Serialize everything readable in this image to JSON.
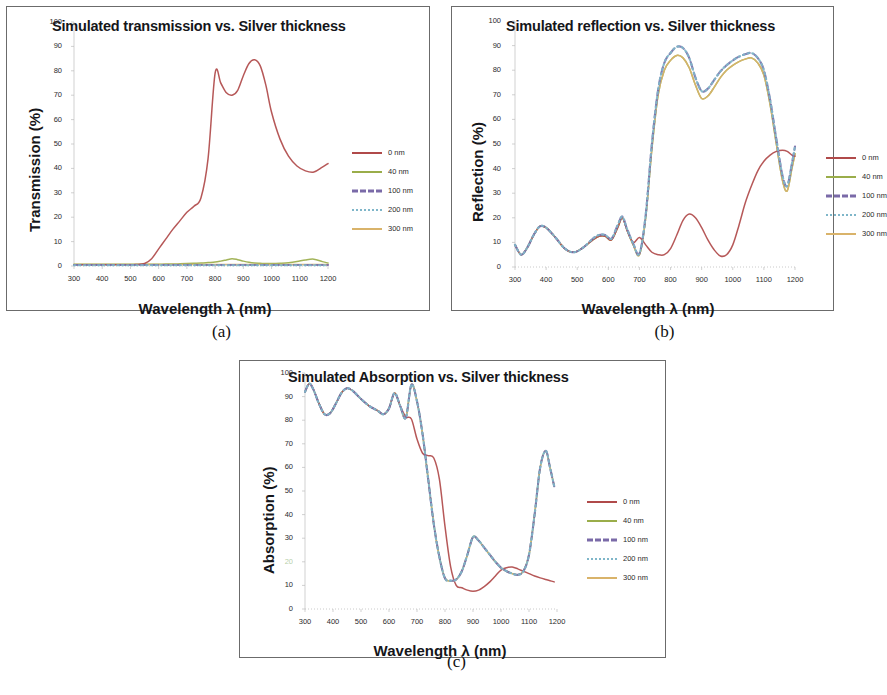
{
  "figure": {
    "panels": [
      {
        "caption": "(a)",
        "title": "Simulated transmission vs. Silver thickness",
        "ylabel": "Transmission (%)",
        "xlabel": "Wavelength λ (nm)"
      },
      {
        "caption": "(b)",
        "title": "Simulated reflection vs. Silver thickness",
        "ylabel": "Reflection (%)",
        "xlabel": "Wavelength λ (nm)"
      },
      {
        "caption": "(c)",
        "title": "Simulated Absorption vs. Silver thickness",
        "ylabel": "Absorption (%)",
        "xlabel": "Wavelength λ (nm)"
      }
    ]
  },
  "colors": {
    "series_0nm": "#b04a4a",
    "series_40nm": "#9aad4a",
    "series_100nm": "#7a6aa8",
    "series_200nm": "#7fb6c9",
    "series_300nm": "#d9b36a",
    "axis": "#bdbdbd",
    "border": "#6b6b6b",
    "text": "#15161a"
  },
  "chart_data": [
    {
      "type": "line",
      "title": "Simulated transmission vs. Silver thickness",
      "xlabel": "Wavelength λ (nm)",
      "ylabel": "Transmission (%)",
      "xlim": [
        300,
        1200
      ],
      "ylim": [
        0,
        100
      ],
      "xticks": [
        300,
        400,
        500,
        600,
        700,
        800,
        900,
        1000,
        1100,
        1200
      ],
      "yticks": [
        0,
        10,
        20,
        30,
        40,
        50,
        60,
        70,
        80,
        90,
        100
      ],
      "grid": false,
      "legend_position": "right",
      "x": [
        300,
        350,
        400,
        450,
        500,
        520,
        550,
        575,
        600,
        625,
        650,
        675,
        700,
        725,
        750,
        775,
        800,
        820,
        840,
        860,
        880,
        900,
        920,
        940,
        960,
        980,
        1000,
        1030,
        1060,
        1090,
        1120,
        1150,
        1180,
        1200
      ],
      "series": [
        {
          "name": "0 nm",
          "color": "#b04a4a",
          "style": "solid",
          "values": [
            0.5,
            0.5,
            0.5,
            0.5,
            0.5,
            0.6,
            1.0,
            3.0,
            7.0,
            11.0,
            15.0,
            18.5,
            22.0,
            24.5,
            28.0,
            44.0,
            79.0,
            75.0,
            71.0,
            70.0,
            72.0,
            78.0,
            83.0,
            84.5,
            82.0,
            74.0,
            63.0,
            52.0,
            45.0,
            41.0,
            39.0,
            38.5,
            40.5,
            42.0
          ]
        },
        {
          "name": "40 nm",
          "color": "#9aad4a",
          "style": "solid",
          "values": [
            0.7,
            0.7,
            0.7,
            0.7,
            0.7,
            0.7,
            0.7,
            0.7,
            0.7,
            0.8,
            0.8,
            0.9,
            1.0,
            1.1,
            1.2,
            1.4,
            1.6,
            2.0,
            2.5,
            3.0,
            2.6,
            2.0,
            1.5,
            1.2,
            1.1,
            1.0,
            1.0,
            1.1,
            1.3,
            1.8,
            2.5,
            2.8,
            1.8,
            1.2
          ]
        },
        {
          "name": "100 nm",
          "color": "#7a6aa8",
          "style": "dashed",
          "values": [
            0.4,
            0.4,
            0.4,
            0.4,
            0.4,
            0.4,
            0.4,
            0.4,
            0.4,
            0.4,
            0.4,
            0.4,
            0.4,
            0.4,
            0.4,
            0.4,
            0.4,
            0.4,
            0.4,
            0.4,
            0.4,
            0.4,
            0.4,
            0.4,
            0.4,
            0.4,
            0.4,
            0.4,
            0.4,
            0.4,
            0.4,
            0.4,
            0.4,
            0.4
          ]
        },
        {
          "name": "200 nm",
          "color": "#7fb6c9",
          "style": "dotted",
          "values": [
            0.3,
            0.3,
            0.3,
            0.3,
            0.3,
            0.3,
            0.3,
            0.3,
            0.3,
            0.3,
            0.3,
            0.3,
            0.3,
            0.3,
            0.3,
            0.3,
            0.3,
            0.3,
            0.3,
            0.3,
            0.3,
            0.3,
            0.3,
            0.3,
            0.3,
            0.3,
            0.3,
            0.3,
            0.3,
            0.3,
            0.3,
            0.3,
            0.3,
            0.3
          ]
        },
        {
          "name": "300 nm",
          "color": "#d9b36a",
          "style": "solid",
          "values": [
            0.6,
            0.6,
            0.6,
            0.6,
            0.6,
            0.6,
            0.6,
            0.6,
            0.6,
            0.6,
            0.6,
            0.6,
            0.6,
            0.6,
            0.6,
            0.6,
            0.6,
            0.6,
            0.6,
            0.6,
            0.6,
            0.6,
            0.6,
            0.6,
            0.6,
            0.6,
            0.6,
            0.6,
            0.6,
            0.6,
            0.6,
            0.6,
            0.6,
            0.6
          ]
        }
      ]
    },
    {
      "type": "line",
      "title": "Simulated reflection vs. Silver thickness",
      "xlabel": "Wavelength λ (nm)",
      "ylabel": "Reflection (%)",
      "xlim": [
        300,
        1200
      ],
      "ylim": [
        0,
        100
      ],
      "xticks": [
        300,
        400,
        500,
        600,
        700,
        800,
        900,
        1000,
        1100,
        1200
      ],
      "yticks": [
        0,
        10,
        20,
        30,
        40,
        50,
        60,
        70,
        80,
        90,
        100
      ],
      "grid": false,
      "legend_position": "right",
      "x": [
        300,
        320,
        340,
        360,
        380,
        400,
        430,
        460,
        490,
        520,
        550,
        570,
        590,
        610,
        630,
        645,
        660,
        680,
        700,
        720,
        740,
        760,
        780,
        800,
        820,
        840,
        860,
        880,
        900,
        920,
        940,
        960,
        980,
        1000,
        1020,
        1040,
        1060,
        1080,
        1100,
        1120,
        1140,
        1160,
        1175,
        1190,
        1200
      ],
      "series": [
        {
          "name": "0 nm",
          "color": "#b04a4a",
          "style": "solid",
          "values": [
            9.0,
            5.0,
            8.0,
            13.0,
            16.5,
            16.0,
            12.0,
            7.5,
            6.0,
            8.0,
            11.0,
            12.5,
            12.5,
            11.0,
            16.0,
            20.0,
            15.0,
            10.0,
            12.0,
            9.0,
            6.0,
            5.0,
            5.0,
            7.5,
            13.0,
            19.0,
            21.5,
            20.0,
            16.0,
            11.0,
            7.0,
            4.5,
            5.0,
            9.0,
            17.0,
            26.0,
            33.0,
            39.0,
            43.0,
            45.5,
            47.0,
            47.5,
            47.0,
            45.5,
            45.0
          ]
        },
        {
          "name": "40 nm",
          "color": "#9aad4a",
          "style": "solid",
          "values": [
            9.0,
            5.0,
            8.0,
            13.0,
            16.5,
            16.0,
            12.0,
            7.5,
            6.0,
            8.0,
            11.0,
            12.5,
            12.5,
            11.0,
            16.0,
            20.0,
            15.0,
            9.0,
            5.0,
            20.0,
            48.0,
            70.0,
            80.0,
            84.0,
            86.0,
            85.0,
            81.0,
            74.0,
            68.5,
            69.5,
            73.0,
            77.0,
            80.0,
            82.0,
            83.5,
            84.5,
            85.0,
            83.0,
            78.0,
            66.0,
            50.0,
            35.0,
            31.0,
            40.0,
            46.0
          ]
        },
        {
          "name": "100 nm",
          "color": "#7a6aa8",
          "style": "dashed",
          "values": [
            9.0,
            5.0,
            8.0,
            13.0,
            16.5,
            16.0,
            12.0,
            7.5,
            6.0,
            8.0,
            11.5,
            13.0,
            13.0,
            11.5,
            17.0,
            20.5,
            15.5,
            9.5,
            5.5,
            21.0,
            50.0,
            72.0,
            83.0,
            87.0,
            89.5,
            89.0,
            85.0,
            77.0,
            71.5,
            72.5,
            76.0,
            79.5,
            82.0,
            84.0,
            85.5,
            86.5,
            87.0,
            85.0,
            80.0,
            68.0,
            52.0,
            37.0,
            33.0,
            42.0,
            49.0
          ]
        },
        {
          "name": "200 nm",
          "color": "#7fb6c9",
          "style": "dotted",
          "values": [
            9.0,
            5.0,
            8.0,
            13.0,
            16.5,
            16.0,
            12.0,
            7.5,
            6.0,
            8.0,
            11.5,
            13.0,
            13.0,
            11.5,
            17.0,
            20.5,
            15.5,
            9.5,
            5.5,
            21.0,
            50.0,
            72.0,
            83.0,
            87.0,
            89.5,
            89.0,
            85.0,
            77.0,
            71.5,
            72.5,
            76.0,
            79.5,
            82.0,
            84.0,
            85.5,
            86.5,
            87.0,
            85.0,
            80.0,
            68.0,
            52.0,
            37.0,
            33.0,
            42.0,
            49.0
          ]
        },
        {
          "name": "300 nm",
          "color": "#d9b36a",
          "style": "solid",
          "values": [
            9.0,
            5.0,
            8.0,
            13.0,
            16.5,
            16.0,
            12.0,
            7.5,
            6.0,
            8.0,
            11.0,
            12.5,
            12.5,
            11.0,
            16.0,
            20.0,
            15.0,
            9.0,
            5.0,
            20.0,
            48.0,
            70.0,
            80.0,
            84.0,
            86.0,
            85.0,
            81.0,
            74.0,
            68.5,
            69.5,
            73.0,
            77.0,
            80.0,
            82.0,
            83.5,
            84.5,
            85.0,
            83.0,
            78.0,
            66.0,
            50.0,
            35.0,
            31.0,
            40.0,
            46.0
          ]
        }
      ]
    },
    {
      "type": "line",
      "title": "Simulated Absorption vs. Silver thickness",
      "xlabel": "Wavelength λ (nm)",
      "ylabel": "Absorption (%)",
      "xlim": [
        300,
        1200
      ],
      "ylim": [
        0,
        100
      ],
      "xticks": [
        300,
        400,
        500,
        600,
        700,
        800,
        900,
        1000,
        1100,
        1200
      ],
      "yticks": [
        0,
        10,
        20,
        30,
        40,
        50,
        60,
        70,
        80,
        90,
        100
      ],
      "grid": false,
      "legend_position": "right",
      "x": [
        300,
        315,
        330,
        350,
        370,
        390,
        410,
        430,
        450,
        470,
        500,
        530,
        560,
        580,
        600,
        620,
        640,
        660,
        680,
        700,
        720,
        740,
        760,
        780,
        800,
        820,
        840,
        860,
        880,
        900,
        920,
        940,
        960,
        980,
        1000,
        1020,
        1040,
        1060,
        1080,
        1100,
        1120,
        1140,
        1160,
        1175,
        1190
      ],
      "series": [
        {
          "name": "0 nm",
          "color": "#b04a4a",
          "style": "solid",
          "values": [
            92.0,
            95.5,
            93.0,
            87.0,
            82.5,
            83.0,
            87.0,
            91.5,
            93.5,
            92.5,
            89.0,
            86.0,
            84.0,
            82.5,
            85.0,
            91.5,
            86.0,
            81.5,
            80.5,
            72.0,
            66.0,
            65.0,
            64.0,
            55.0,
            35.0,
            18.0,
            10.0,
            9.0,
            8.0,
            7.5,
            8.0,
            9.5,
            11.5,
            14.0,
            16.5,
            17.5,
            17.8,
            17.0,
            16.0,
            15.0,
            14.0,
            13.2,
            12.5,
            12.0,
            11.5
          ]
        },
        {
          "name": "40 nm",
          "color": "#9aad4a",
          "style": "solid",
          "values": [
            92.0,
            95.5,
            93.0,
            87.0,
            82.5,
            83.0,
            87.0,
            91.5,
            93.5,
            92.5,
            89.0,
            86.0,
            84.0,
            82.5,
            85.0,
            91.5,
            86.0,
            81.0,
            95.0,
            88.0,
            74.0,
            55.0,
            36.0,
            22.0,
            13.0,
            12.0,
            12.5,
            16.0,
            23.0,
            30.5,
            29.0,
            26.0,
            23.0,
            20.0,
            17.5,
            16.0,
            15.0,
            14.5,
            16.0,
            23.0,
            40.0,
            60.0,
            67.0,
            60.0,
            52.0
          ]
        },
        {
          "name": "100 nm",
          "color": "#7a6aa8",
          "style": "dashed",
          "values": [
            92.0,
            95.5,
            93.0,
            87.0,
            82.5,
            83.0,
            87.0,
            91.5,
            93.5,
            92.5,
            89.0,
            86.0,
            84.0,
            82.5,
            85.0,
            91.5,
            86.0,
            81.0,
            95.0,
            88.0,
            74.0,
            55.0,
            36.0,
            22.0,
            13.0,
            12.0,
            12.5,
            16.0,
            23.0,
            30.5,
            29.0,
            26.0,
            23.0,
            20.0,
            17.5,
            16.0,
            15.0,
            14.5,
            16.0,
            23.0,
            40.0,
            60.0,
            67.0,
            60.0,
            52.0
          ]
        },
        {
          "name": "200 nm",
          "color": "#7fb6c9",
          "style": "dotted",
          "values": [
            92.0,
            95.5,
            93.0,
            87.0,
            82.5,
            83.0,
            87.0,
            91.5,
            93.5,
            92.5,
            89.0,
            86.0,
            84.0,
            82.5,
            85.0,
            91.5,
            86.0,
            81.0,
            95.0,
            88.0,
            74.0,
            55.0,
            36.0,
            22.0,
            13.0,
            12.0,
            12.5,
            16.0,
            23.0,
            30.5,
            29.0,
            26.0,
            23.0,
            20.0,
            17.5,
            16.0,
            15.0,
            14.5,
            16.0,
            23.0,
            40.0,
            60.0,
            67.0,
            60.0,
            52.0
          ]
        },
        {
          "name": "300 nm",
          "color": "#d9b36a",
          "style": "solid",
          "values": [
            92.0,
            95.5,
            93.0,
            87.0,
            82.5,
            83.0,
            87.0,
            91.5,
            93.5,
            92.5,
            89.0,
            86.0,
            84.0,
            82.5,
            85.0,
            91.5,
            86.0,
            81.0,
            95.0,
            88.0,
            74.0,
            55.0,
            36.0,
            22.0,
            13.0,
            12.0,
            12.5,
            16.0,
            23.0,
            30.5,
            29.0,
            26.0,
            23.0,
            20.0,
            17.5,
            16.0,
            15.0,
            14.5,
            16.0,
            23.0,
            40.0,
            60.0,
            67.0,
            60.0,
            52.0
          ]
        }
      ]
    }
  ]
}
